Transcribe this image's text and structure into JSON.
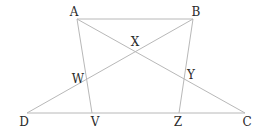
{
  "diagram": {
    "type": "geometry",
    "points": {
      "A": {
        "label": "A",
        "x": 77,
        "y": 19,
        "lx": 74,
        "ly": 12
      },
      "B": {
        "label": "B",
        "x": 193,
        "y": 19,
        "lx": 196,
        "ly": 12
      },
      "C": {
        "label": "C",
        "x": 245,
        "y": 113,
        "lx": 247,
        "ly": 122
      },
      "D": {
        "label": "D",
        "x": 27,
        "y": 113,
        "lx": 24,
        "ly": 122
      },
      "V": {
        "label": "V",
        "x": 92,
        "y": 113,
        "lx": 95,
        "ly": 122
      },
      "Z": {
        "label": "Z",
        "x": 179,
        "y": 113,
        "lx": 178,
        "ly": 122
      },
      "W": {
        "label": "W",
        "x": 87,
        "y": 80,
        "lx": 78,
        "ly": 79
      },
      "X": {
        "label": "X",
        "x": 135,
        "y": 50,
        "lx": 135,
        "ly": 42
      },
      "Y": {
        "label": "Y",
        "x": 183,
        "y": 77,
        "lx": 191,
        "ly": 75
      }
    },
    "segments": [
      [
        "A",
        "B"
      ],
      [
        "A",
        "V"
      ],
      [
        "A",
        "C"
      ],
      [
        "B",
        "D"
      ],
      [
        "B",
        "Z"
      ],
      [
        "D",
        "C"
      ]
    ],
    "line_color": "#b8b8b8",
    "label_color": "#2a2a2a"
  }
}
